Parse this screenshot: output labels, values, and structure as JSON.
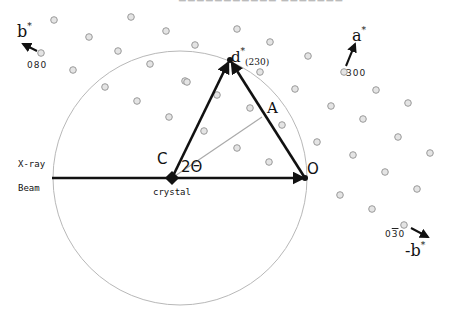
{
  "labels": {
    "b_star": "b",
    "a_star": "a",
    "neg_b_star": "-b",
    "star": "*",
    "idx_080": "080",
    "idx_300": "300",
    "idx_030_a": "0",
    "idx_030_b": "3",
    "idx_030_c": "0",
    "d_star": "d",
    "d_sub": "(230)",
    "point_A": "A",
    "point_C": "C",
    "point_O": "O",
    "angle": "2Θ",
    "xray_1": "X-ray",
    "xray_2": "Beam",
    "crystal": "crystal"
  },
  "geometry": {
    "ewald_circle": {
      "cx": 180,
      "cy": 178,
      "r": 127
    },
    "crystal": [
      172,
      178
    ],
    "origin": [
      305,
      178
    ],
    "d_star_point": [
      230,
      60
    ],
    "A_point": [
      262,
      117
    ],
    "lattice_dots": [
      [
        54,
        20
      ],
      [
        131,
        17
      ],
      [
        89,
        37
      ],
      [
        166,
        31
      ],
      [
        41,
        53
      ],
      [
        118,
        51
      ],
      [
        195,
        45
      ],
      [
        73,
        70
      ],
      [
        150,
        64
      ],
      [
        105,
        87
      ],
      [
        185,
        81
      ],
      [
        137,
        101
      ],
      [
        169,
        117
      ],
      [
        204,
        131
      ],
      [
        217,
        95
      ],
      [
        237,
        29
      ],
      [
        270,
        42
      ],
      [
        308,
        56
      ],
      [
        260,
        72
      ],
      [
        295,
        89
      ],
      [
        344,
        72
      ],
      [
        376,
        90
      ],
      [
        331,
        106
      ],
      [
        363,
        119
      ],
      [
        408,
        103
      ],
      [
        250,
        108
      ],
      [
        282,
        125
      ],
      [
        237,
        148
      ],
      [
        317,
        142
      ],
      [
        353,
        155
      ],
      [
        398,
        137
      ],
      [
        430,
        153
      ],
      [
        269,
        162
      ],
      [
        385,
        172
      ],
      [
        340,
        195
      ],
      [
        417,
        189
      ],
      [
        372,
        209
      ],
      [
        404,
        225
      ],
      [
        187,
        82
      ]
    ]
  },
  "colors": {
    "line": "#111111",
    "circle": "#b8b8b8",
    "dot": "#9a9a9a",
    "dot_fill": "#e4e4e4"
  }
}
